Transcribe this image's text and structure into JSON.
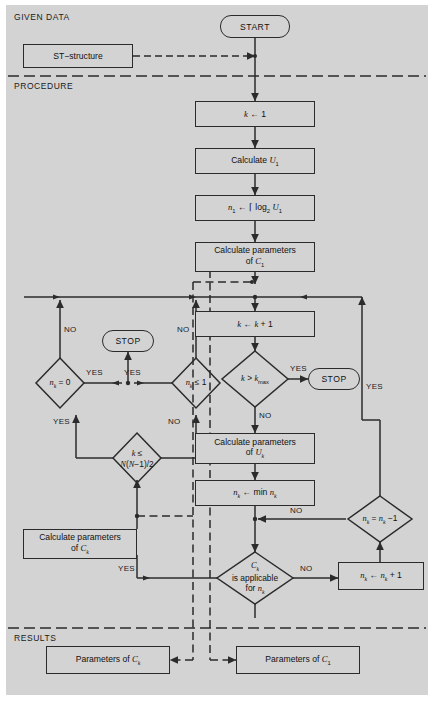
{
  "diagram": {
    "background_color": "#d3d3d3",
    "line_color": "#2b2b2b",
    "sections": [
      {
        "id": "given-data",
        "label": "GIVEN DATA"
      },
      {
        "id": "procedure",
        "label": "PROCEDURE"
      },
      {
        "id": "results",
        "label": "RESULTS"
      }
    ],
    "nodes": {
      "start": {
        "type": "terminal",
        "label": "START"
      },
      "st_structure": {
        "type": "process",
        "label": "ST−structure"
      },
      "k_init": {
        "type": "process",
        "label": "k ← 1"
      },
      "calc_u1": {
        "type": "process",
        "label": "Calculate U₁"
      },
      "n1_log": {
        "type": "process",
        "label": "n₁ ← ⌈ log₂ U₁"
      },
      "calc_params_c1": {
        "type": "process",
        "label": "Calculate parameters of C₁"
      },
      "k_incr": {
        "type": "process",
        "label": "k ← k + 1"
      },
      "k_gt_kmax": {
        "type": "decision",
        "label": "k > k_max"
      },
      "stop_right": {
        "type": "terminal",
        "label": "STOP"
      },
      "calc_params_uk": {
        "type": "process",
        "label": "Calculate parameters of U_k"
      },
      "nk_min": {
        "type": "process",
        "label": "n_k ← min n_k"
      },
      "nk_minus": {
        "type": "decision",
        "label": "n_k = n_k −1"
      },
      "ck_applicable": {
        "type": "decision",
        "label": "C_k is applicable for n_k"
      },
      "nk_plus": {
        "type": "process",
        "label": "n_k ← n_k + 1"
      },
      "nk_eq_zero": {
        "type": "decision",
        "label": "n_k = 0"
      },
      "nk_le_one": {
        "type": "decision",
        "label": "n_k ≤ 1"
      },
      "stop_left": {
        "type": "terminal",
        "label": "STOP"
      },
      "k_le_n": {
        "type": "decision",
        "label": "k ≤ N(N−1)/2"
      },
      "calc_params_ck": {
        "type": "process",
        "label": "Calculate parameters of C_k"
      },
      "result_ck": {
        "type": "process",
        "label": "Parameters of C_k"
      },
      "result_c1": {
        "type": "process",
        "label": "Parameters of C₁"
      }
    },
    "edge_labels": {
      "kmax_yes": "YES",
      "kmax_no": "NO",
      "nk_minus_no": "NO",
      "ck_app_no": "NO",
      "ck_app_yes": "YES",
      "right_feedback_yes": "YES",
      "nk_zero_no": "NO",
      "nk_zero_yes": "YES",
      "nk_one_no": "NO",
      "nk_one_yes": "YES",
      "k_le_n_yes": "YES",
      "k_le_n_no": "NO"
    }
  }
}
